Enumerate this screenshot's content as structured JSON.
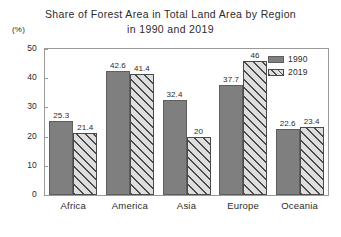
{
  "chart_data": {
    "type": "bar",
    "title": "Share of Forest Area in Total Land Area by Region in 1990 and 2019",
    "title_line_1": "Share of Forest Area in Total Land Area by Region",
    "title_line_2": "in 1990 and 2019",
    "xlabel": "",
    "ylabel": "",
    "yunit": "(%)",
    "ylim": [
      0,
      50
    ],
    "yticks": [
      0,
      10,
      20,
      30,
      40,
      50
    ],
    "ytick_labels": [
      "0",
      "10",
      "20",
      "30",
      "40",
      "50"
    ],
    "grid": false,
    "legend_position": "top-right-inside",
    "categories": [
      "Africa",
      "America",
      "Asia",
      "Europe",
      "Oceania"
    ],
    "series": [
      {
        "name": "1990",
        "color": "#7f7f7f",
        "pattern": "solid",
        "values": [
          25.3,
          42.6,
          32.4,
          37.7,
          22.6
        ],
        "labels": [
          "25.3",
          "42.6",
          "32.4",
          "37.7",
          "22.6"
        ]
      },
      {
        "name": "2019",
        "color": "#dedede",
        "pattern": "diagonal-hatch",
        "values": [
          21.4,
          41.4,
          20,
          46,
          23.4
        ],
        "labels": [
          "21.4",
          "41.4",
          "20",
          "46",
          "23.4"
        ]
      }
    ]
  },
  "legend": {
    "entries": [
      {
        "label": "1990"
      },
      {
        "label": "2019"
      }
    ]
  },
  "colors": {
    "series_1990": "#7f7f7f",
    "series_2019_fill": "#dedede",
    "series_2019_hatch": "#4a4a4a",
    "frame": "#9a9a9a",
    "text": "#2b2b2b",
    "background": "#ffffff"
  }
}
